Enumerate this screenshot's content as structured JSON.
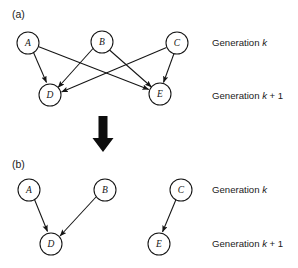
{
  "figure": {
    "background_color": "#ffffff",
    "stroke_color": "#141414",
    "width": 298,
    "height": 268
  },
  "panels": [
    {
      "tag": "(a)",
      "tag_pos": {
        "x": 12,
        "y": 18
      },
      "nodes": [
        {
          "id": "A",
          "label": "A",
          "x": 28,
          "y": 43,
          "r": 11,
          "generation": "k"
        },
        {
          "id": "B",
          "label": "B",
          "x": 102,
          "y": 42,
          "r": 11,
          "generation": "k"
        },
        {
          "id": "C",
          "label": "C",
          "x": 177,
          "y": 43,
          "r": 11,
          "generation": "k"
        },
        {
          "id": "D",
          "label": "D",
          "x": 50,
          "y": 95,
          "r": 11,
          "generation": "k + 1"
        },
        {
          "id": "E",
          "label": "E",
          "x": 160,
          "y": 94,
          "r": 11,
          "generation": "k + 1"
        }
      ],
      "edges": [
        {
          "from": "A",
          "to": "D"
        },
        {
          "from": "A",
          "to": "E"
        },
        {
          "from": "B",
          "to": "D"
        },
        {
          "from": "B",
          "to": "E"
        },
        {
          "from": "C",
          "to": "D"
        },
        {
          "from": "C",
          "to": "E"
        }
      ],
      "generation_labels": [
        {
          "text_prefix": "Generation ",
          "text_italic": "k",
          "text_suffix": "",
          "x": 212,
          "y": 46
        },
        {
          "text_prefix": "Generation ",
          "text_italic": "k",
          "text_suffix": " + 1",
          "x": 212,
          "y": 99
        }
      ]
    },
    {
      "tag": "(b)",
      "tag_pos": {
        "x": 12,
        "y": 168
      },
      "nodes": [
        {
          "id": "A",
          "label": "A",
          "x": 29,
          "y": 190,
          "r": 11,
          "generation": "k"
        },
        {
          "id": "B",
          "label": "B",
          "x": 105,
          "y": 190,
          "r": 11,
          "generation": "k"
        },
        {
          "id": "C",
          "label": "C",
          "x": 181,
          "y": 190,
          "r": 11,
          "generation": "k"
        },
        {
          "id": "D",
          "label": "D",
          "x": 51,
          "y": 244,
          "r": 11,
          "generation": "k + 1"
        },
        {
          "id": "E",
          "label": "E",
          "x": 159,
          "y": 244,
          "r": 11,
          "generation": "k + 1"
        }
      ],
      "edges": [
        {
          "from": "A",
          "to": "D"
        },
        {
          "from": "B",
          "to": "D"
        },
        {
          "from": "C",
          "to": "E"
        }
      ],
      "generation_labels": [
        {
          "text_prefix": "Generation ",
          "text_italic": "k",
          "text_suffix": "",
          "x": 212,
          "y": 193
        },
        {
          "text_prefix": "Generation ",
          "text_italic": "k",
          "text_suffix": " + 1",
          "x": 212,
          "y": 247
        }
      ]
    }
  ],
  "transition_arrow": {
    "name": "downward-block-arrow",
    "direction": "down",
    "x_center": 103,
    "y_top": 116,
    "y_bottom": 152,
    "shaft_width": 9,
    "head_width": 21,
    "color": "#0d0d0d"
  }
}
